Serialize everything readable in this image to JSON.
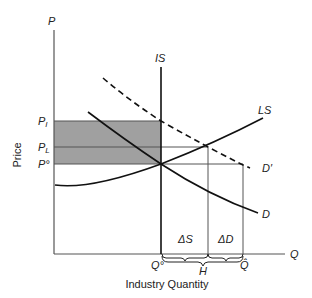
{
  "axes": {
    "y_axis_symbol": "P",
    "x_axis_symbol": "Q",
    "y_axis_title": "Price",
    "x_axis_title": "Industry Quantity"
  },
  "price_labels": {
    "p_i": "P",
    "p_i_sub": "I",
    "p_l": "P",
    "p_l_sub": "L",
    "p_0": "P°"
  },
  "curve_labels": {
    "is": "IS",
    "ls": "LS",
    "d": "D",
    "d_prime": "D′"
  },
  "quantity_labels": {
    "q_0": "Q°",
    "h": "H",
    "q_hat": "Q̂",
    "delta_s": "ΔS",
    "delta_d": "ΔD"
  },
  "colors": {
    "shaded_area": "#a0a0a0",
    "curve": "#111111",
    "guide_line": "#555555"
  }
}
